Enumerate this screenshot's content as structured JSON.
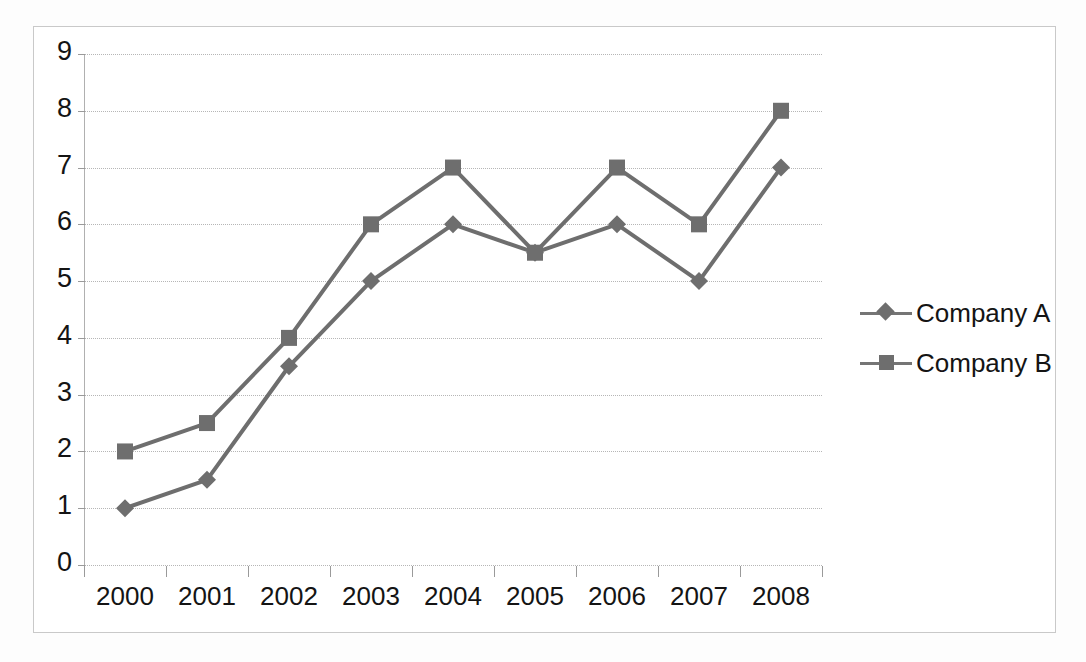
{
  "chart_data": {
    "type": "line",
    "title": "",
    "subtitle": "",
    "xlabel": "",
    "ylabel": "",
    "categories": [
      "2000",
      "2001",
      "2002",
      "2003",
      "2004",
      "2005",
      "2006",
      "2007",
      "2008"
    ],
    "series": [
      {
        "name": "Company A",
        "marker": "diamond",
        "color": "#6e6e6e",
        "values": [
          1,
          1.5,
          3.5,
          5,
          6,
          5.5,
          6,
          5,
          7
        ]
      },
      {
        "name": "Company B",
        "marker": "square",
        "color": "#6e6e6e",
        "values": [
          2,
          2.5,
          4,
          6,
          7,
          5.5,
          7,
          6,
          8
        ]
      }
    ],
    "ylim": [
      0,
      9
    ],
    "y_ticks": [
      "0",
      "1",
      "2",
      "3",
      "4",
      "5",
      "6",
      "7",
      "8",
      "9"
    ],
    "grid": true,
    "legend_position": "right",
    "legend": [
      "Company A",
      "Company B"
    ]
  },
  "chart": {
    "line_color": "#757575",
    "grid_color": "#b6b6b6",
    "axis_color": "#9a9a9a",
    "border_color": "#c9c9c9",
    "background": "#ffffff"
  },
  "legend": {
    "items": [
      {
        "label": "Company A",
        "marker": "diamond-marker-icon"
      },
      {
        "label": "Company B",
        "marker": "square-marker-icon"
      }
    ]
  }
}
